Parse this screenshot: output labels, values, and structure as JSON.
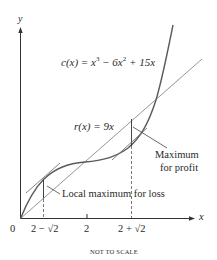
{
  "figure": {
    "axes": {
      "x_label": "x",
      "y_label": "y",
      "origin_label": "0"
    },
    "x_ticks": [
      "2 − √2",
      "2",
      "2 + √2"
    ],
    "curves": {
      "cost": {
        "label_prefix": "c(x) = x",
        "label": "c(x) = x³ − 6x² + 15x",
        "exp1": "3",
        "mid": " − 6x",
        "exp2": "2",
        "tail": " + 15x"
      },
      "revenue": {
        "label": "r(x) = 9x"
      }
    },
    "annotations": {
      "loss": "Local maximum for loss",
      "profit_line1": "Maximum",
      "profit_line2": "for profit"
    },
    "footnote": "NOT TO SCALE",
    "colors": {
      "curve": "#555555",
      "line": "#777777",
      "text": "#2a2a2a"
    }
  }
}
